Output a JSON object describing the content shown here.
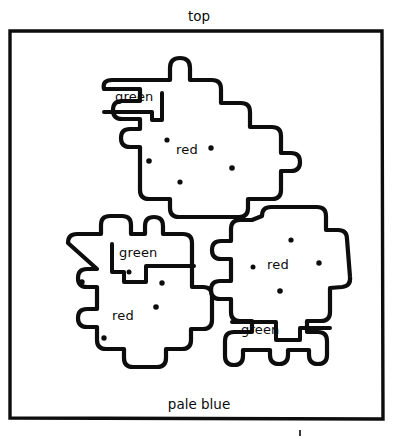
{
  "figure": {
    "title": "top",
    "background_label": "pale blue",
    "stroke_color": "#0d0d0d",
    "fill_color": "#ffffff",
    "page_background": "#ffffff",
    "width": 399,
    "height": 443
  },
  "frame": {
    "x": 9,
    "y": 30,
    "width": 374,
    "height": 390
  },
  "labels": {
    "top": "top",
    "pale_blue": "pale blue",
    "green": "green",
    "red": "red"
  },
  "regions": [
    {
      "id": "shape-top",
      "name": "top-center-blob",
      "parts": [
        {
          "label": "green",
          "label_x": 115,
          "label_y": 101,
          "dots": []
        },
        {
          "label": "red",
          "label_x": 176,
          "label_y": 154,
          "dots": [
            {
              "x": 167,
              "y": 140
            },
            {
              "x": 149,
              "y": 161
            },
            {
              "x": 211,
              "y": 148
            },
            {
              "x": 232,
              "y": 168
            },
            {
              "x": 180,
              "y": 182
            }
          ]
        }
      ]
    },
    {
      "id": "shape-bottom-left",
      "name": "bottom-left-blob",
      "parts": [
        {
          "label": "green",
          "label_x": 119,
          "label_y": 257,
          "dots": []
        },
        {
          "label": "red",
          "label_x": 112,
          "label_y": 320,
          "dots": [
            {
              "x": 82,
              "y": 282
            },
            {
              "x": 162,
              "y": 283
            },
            {
              "x": 156,
              "y": 307
            },
            {
              "x": 104,
              "y": 338
            },
            {
              "x": 129,
              "y": 272
            }
          ]
        }
      ]
    },
    {
      "id": "shape-bottom-right",
      "name": "bottom-right-blob",
      "parts": [
        {
          "label": "green",
          "label_x": 241,
          "label_y": 334,
          "dots": []
        },
        {
          "label": "red",
          "label_x": 267,
          "label_y": 269,
          "dots": [
            {
              "x": 291,
              "y": 240
            },
            {
              "x": 253,
              "y": 267
            },
            {
              "x": 319,
              "y": 263
            },
            {
              "x": 280,
              "y": 291
            }
          ]
        }
      ]
    }
  ],
  "counts": {
    "shapes": 3,
    "green_labels": 3,
    "red_labels": 3,
    "total_dots": 14
  }
}
